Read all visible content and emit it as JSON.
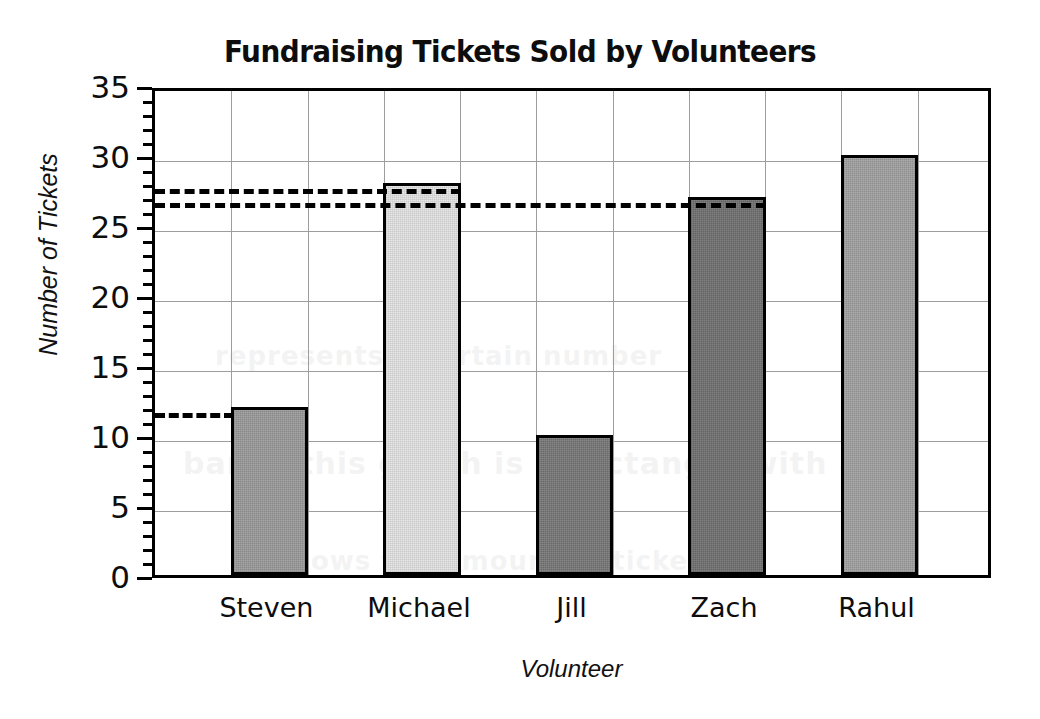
{
  "chart_data": {
    "type": "bar",
    "title": "Fundraising Tickets Sold by Volunteers",
    "xlabel": "Volunteer",
    "ylabel": "Number of Tickets",
    "categories": [
      "Steven",
      "Michael",
      "Jill",
      "Zach",
      "Rahul"
    ],
    "values": [
      12,
      28,
      10,
      27,
      30
    ],
    "ylim": [
      0,
      35
    ],
    "ytick_labels": [
      "0",
      "5",
      "10",
      "15",
      "20",
      "25",
      "30",
      "35"
    ],
    "ytick_values": [
      0,
      5,
      10,
      15,
      20,
      25,
      30,
      35
    ],
    "yminor_step": 1,
    "grid": "both",
    "legend": "none",
    "bar_colors": [
      "#9a9a9a",
      "#e3e3e3",
      "#777777",
      "#707070",
      "#a0a0a0"
    ],
    "bar_edge_color": "#000000",
    "gridline_color": "#9d9d9d",
    "annotations": [
      {
        "name": "reference-line-28",
        "value": 28,
        "style": "dashed",
        "extent": "axis-to-michael"
      },
      {
        "name": "reference-line-27",
        "value": 27,
        "style": "dashed",
        "extent": "axis-to-zach"
      },
      {
        "name": "reference-line-12",
        "value": 12,
        "style": "dashed",
        "extent": "axis-to-steven"
      }
    ]
  },
  "ghost_text": {
    "line1": "bar in this graph is a rectangle with a",
    "line2": "shows the amount of tickets",
    "line3": "represents a certain number"
  }
}
